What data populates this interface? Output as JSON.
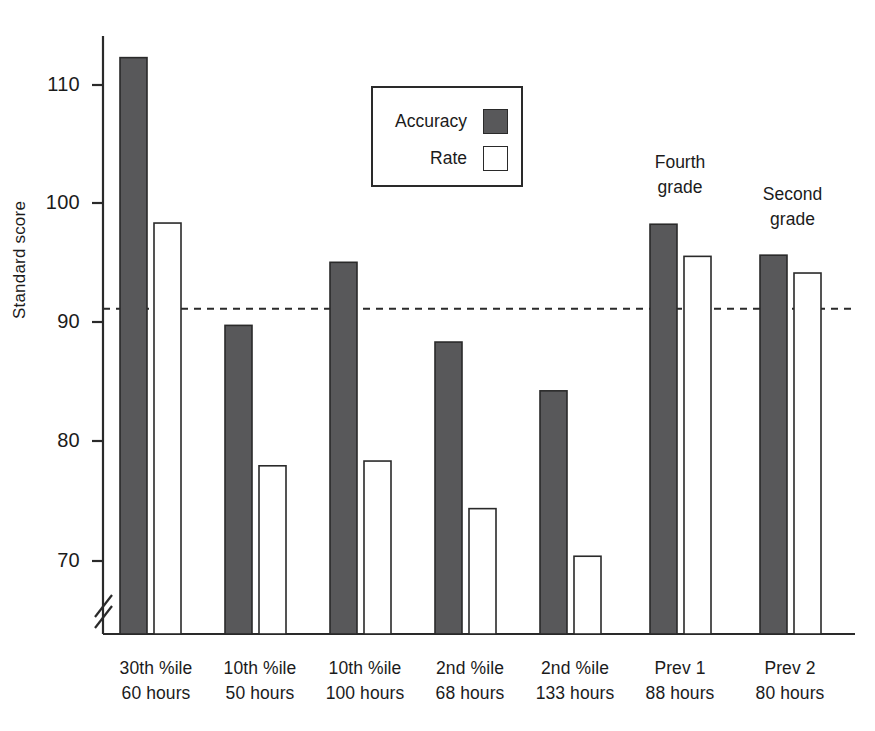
{
  "chart_data": {
    "type": "bar",
    "title": "",
    "xlabel": "",
    "ylabel": "Standard score",
    "ylim": [
      64,
      115
    ],
    "yticks": [
      70,
      80,
      90,
      100,
      110
    ],
    "ytick_labels": [
      "70",
      "80",
      "90",
      "100",
      "110"
    ],
    "axis_break": true,
    "grid": false,
    "legend_position": "upper-center",
    "reference_line": {
      "value": 91.2,
      "style": "dashed",
      "label": ""
    },
    "categories": [
      "30th %ile\n60 hours",
      "10th %ile\n50 hours",
      "10th %ile\n100 hours",
      "2nd %ile\n68 hours",
      "2nd %ile\n133 hours",
      "Prev 1\n88 hours",
      "Prev 2\n80 hours"
    ],
    "category_lines": [
      {
        "l1": "30th %ile",
        "l2": "60 hours"
      },
      {
        "l1": "10th %ile",
        "l2": "50 hours"
      },
      {
        "l1": "10th %ile",
        "l2": "100 hours"
      },
      {
        "l1": "2nd %ile",
        "l2": "68 hours"
      },
      {
        "l1": "2nd %ile",
        "l2": "133 hours"
      },
      {
        "l1": "Prev 1",
        "l2": "88 hours"
      },
      {
        "l1": "Prev 2",
        "l2": "80 hours"
      }
    ],
    "series": [
      {
        "name": "Accuracy",
        "fill": "#58585a",
        "values": [
          112.3,
          89.8,
          95.1,
          88.4,
          84.3,
          98.3,
          95.7
        ]
      },
      {
        "name": "Rate",
        "fill": "#ffffff",
        "values": [
          98.4,
          78.0,
          78.4,
          74.4,
          70.4,
          95.6,
          94.2
        ]
      }
    ],
    "annotations": [
      {
        "lines": {
          "l1": "Fourth",
          "l2": "grade"
        },
        "target_group": 5
      },
      {
        "lines": {
          "l1": "Second",
          "l2": "grade"
        },
        "target_group": 6
      }
    ]
  },
  "legend": {
    "items": [
      {
        "label": "Accuracy",
        "swatch": "filled-dark"
      },
      {
        "label": "Rate",
        "swatch": "open-white"
      }
    ]
  },
  "colors": {
    "accuracy_fill": "#58585a",
    "rate_fill": "#ffffff",
    "axis": "#2a2a2a",
    "text": "#1b1b1b",
    "background": "#ffffff"
  }
}
